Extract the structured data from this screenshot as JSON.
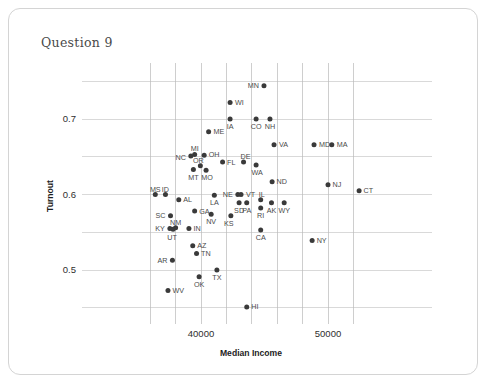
{
  "card": {
    "title": "Question 9"
  },
  "chart_data": {
    "type": "scatter",
    "title": "Question 9",
    "xlabel": "Median Income",
    "ylabel": "Turnout",
    "xlim": [
      35000,
      53000
    ],
    "ylim": [
      0.43,
      0.775
    ],
    "grid": true,
    "legend": "none",
    "xticks": [
      40000,
      50000
    ],
    "xticklabels": [
      "40000",
      "50000"
    ],
    "yticks": [
      0.5,
      0.6,
      0.7
    ],
    "yticklabels": [
      "0.5",
      "0.6",
      "0.7"
    ],
    "xgridlines": [
      36000,
      38000,
      40000,
      42000,
      44000,
      46000,
      48000,
      50000,
      52000
    ],
    "ygridlines": [
      0.45,
      0.5,
      0.55,
      0.6,
      0.65,
      0.7,
      0.75
    ],
    "point_color": "#3a3a3a",
    "points": [
      {
        "label": "MN",
        "x": 44960,
        "y": 0.744,
        "lx": -5,
        "ly": 2.5,
        "anchor": "end"
      },
      {
        "label": "WI",
        "x": 42290,
        "y": 0.722,
        "lx": 5,
        "ly": 2.5,
        "anchor": "start"
      },
      {
        "label": "IA",
        "x": 42290,
        "y": 0.7,
        "lx": 0,
        "ly": 10,
        "anchor": "middle"
      },
      {
        "label": "CO",
        "x": 44340,
        "y": 0.7,
        "lx": 0,
        "ly": 10,
        "anchor": "middle"
      },
      {
        "label": "NH",
        "x": 45430,
        "y": 0.7,
        "lx": 0,
        "ly": 10,
        "anchor": "middle"
      },
      {
        "label": "ME",
        "x": 40600,
        "y": 0.683,
        "lx": 5,
        "ly": 2.5,
        "anchor": "start"
      },
      {
        "label": "VA",
        "x": 45750,
        "y": 0.666,
        "lx": 5,
        "ly": 2.5,
        "anchor": "start"
      },
      {
        "label": "MD",
        "x": 48900,
        "y": 0.666,
        "lx": 5,
        "ly": 2.5,
        "anchor": "start"
      },
      {
        "label": "MA",
        "x": 50300,
        "y": 0.666,
        "lx": 5,
        "ly": 2.5,
        "anchor": "start"
      },
      {
        "label": "MI",
        "x": 39500,
        "y": 0.653,
        "lx": 0,
        "ly": -3,
        "anchor": "middle"
      },
      {
        "label": "NC",
        "x": 39200,
        "y": 0.651,
        "lx": -5,
        "ly": 4.5,
        "anchor": "end"
      },
      {
        "label": "OH",
        "x": 40250,
        "y": 0.652,
        "lx": 4.5,
        "ly": 2,
        "anchor": "start"
      },
      {
        "label": "FL",
        "x": 41700,
        "y": 0.643,
        "lx": 4.5,
        "ly": 2.5,
        "anchor": "start"
      },
      {
        "label": "DE",
        "x": 43350,
        "y": 0.643,
        "lx": 2,
        "ly": -3,
        "anchor": "middle"
      },
      {
        "label": "WA",
        "x": 44340,
        "y": 0.639,
        "lx": 1,
        "ly": 9.5,
        "anchor": "middle"
      },
      {
        "label": "OR",
        "x": 39950,
        "y": 0.638,
        "lx": -2,
        "ly": -3,
        "anchor": "middle"
      },
      {
        "label": "MT",
        "x": 39400,
        "y": 0.633,
        "lx": 0,
        "ly": 10,
        "anchor": "middle"
      },
      {
        "label": "MO",
        "x": 40400,
        "y": 0.632,
        "lx": 1,
        "ly": 10,
        "anchor": "middle"
      },
      {
        "label": "ND",
        "x": 45600,
        "y": 0.617,
        "lx": 4.5,
        "ly": 2.5,
        "anchor": "start"
      },
      {
        "label": "NJ",
        "x": 50000,
        "y": 0.613,
        "lx": 4.5,
        "ly": 2.5,
        "anchor": "start"
      },
      {
        "label": "CT",
        "x": 52450,
        "y": 0.605,
        "lx": 4.5,
        "ly": 2.5,
        "anchor": "start"
      },
      {
        "label": "MS",
        "x": 36400,
        "y": 0.6,
        "lx": 0,
        "ly": -3,
        "anchor": "middle"
      },
      {
        "label": "ID",
        "x": 37200,
        "y": 0.6,
        "lx": 0,
        "ly": -3,
        "anchor": "middle"
      },
      {
        "label": "NE",
        "x": 42900,
        "y": 0.6,
        "lx": -5,
        "ly": 2.5,
        "anchor": "end"
      },
      {
        "label": "VT",
        "x": 43150,
        "y": 0.6,
        "lx": 5,
        "ly": 2.5,
        "anchor": "start"
      },
      {
        "label": "LA",
        "x": 41050,
        "y": 0.599,
        "lx": 0,
        "ly": 10,
        "anchor": "middle"
      },
      {
        "label": "AL",
        "x": 38250,
        "y": 0.593,
        "lx": 4.5,
        "ly": 2.5,
        "anchor": "start"
      },
      {
        "label": "IL",
        "x": 44700,
        "y": 0.593,
        "lx": 1,
        "ly": -3,
        "anchor": "middle"
      },
      {
        "label": "SD",
        "x": 43000,
        "y": 0.589,
        "lx": 0,
        "ly": 10,
        "anchor": "middle"
      },
      {
        "label": "PA",
        "x": 43600,
        "y": 0.589,
        "lx": 0,
        "ly": 10,
        "anchor": "middle"
      },
      {
        "label": "AK",
        "x": 45550,
        "y": 0.589,
        "lx": 0,
        "ly": 10,
        "anchor": "middle"
      },
      {
        "label": "WY",
        "x": 46550,
        "y": 0.589,
        "lx": 0,
        "ly": 10,
        "anchor": "middle"
      },
      {
        "label": "RI",
        "x": 44700,
        "y": 0.582,
        "lx": 0,
        "ly": 10,
        "anchor": "middle"
      },
      {
        "label": "GA",
        "x": 39500,
        "y": 0.578,
        "lx": 4.5,
        "ly": 2.5,
        "anchor": "start"
      },
      {
        "label": "NV",
        "x": 40800,
        "y": 0.574,
        "lx": 0,
        "ly": 10,
        "anchor": "middle"
      },
      {
        "label": "SC",
        "x": 37600,
        "y": 0.572,
        "lx": -5,
        "ly": 2.5,
        "anchor": "end"
      },
      {
        "label": "KS",
        "x": 42350,
        "y": 0.572,
        "lx": -2,
        "ly": 10,
        "anchor": "middle"
      },
      {
        "label": "NM",
        "x": 38000,
        "y": 0.556,
        "lx": 0,
        "ly": -3,
        "anchor": "middle"
      },
      {
        "label": "KY",
        "x": 37550,
        "y": 0.555,
        "lx": -5,
        "ly": 2.5,
        "anchor": "end"
      },
      {
        "label": "UT",
        "x": 37800,
        "y": 0.554,
        "lx": -1,
        "ly": 10.5,
        "anchor": "middle"
      },
      {
        "label": "IN",
        "x": 39050,
        "y": 0.555,
        "lx": 4.5,
        "ly": 2.5,
        "anchor": "start"
      },
      {
        "label": "CA",
        "x": 44700,
        "y": 0.553,
        "lx": 0,
        "ly": 10,
        "anchor": "middle"
      },
      {
        "label": "NY",
        "x": 48750,
        "y": 0.539,
        "lx": 4.5,
        "ly": 2.5,
        "anchor": "start"
      },
      {
        "label": "AZ",
        "x": 39350,
        "y": 0.532,
        "lx": 4.5,
        "ly": 2.5,
        "anchor": "start"
      },
      {
        "label": "TN",
        "x": 39650,
        "y": 0.522,
        "lx": 4.5,
        "ly": 2.5,
        "anchor": "start"
      },
      {
        "label": "AR",
        "x": 37750,
        "y": 0.513,
        "lx": -5,
        "ly": 2.5,
        "anchor": "end"
      },
      {
        "label": "TX",
        "x": 41250,
        "y": 0.5,
        "lx": 0,
        "ly": 10,
        "anchor": "middle"
      },
      {
        "label": "OK",
        "x": 39850,
        "y": 0.491,
        "lx": 0,
        "ly": 10,
        "anchor": "middle"
      },
      {
        "label": "WV",
        "x": 37400,
        "y": 0.473,
        "lx": 4.5,
        "ly": 2.5,
        "anchor": "start"
      },
      {
        "label": "HI",
        "x": 43600,
        "y": 0.451,
        "lx": 4.5,
        "ly": 2.5,
        "anchor": "start"
      }
    ]
  }
}
